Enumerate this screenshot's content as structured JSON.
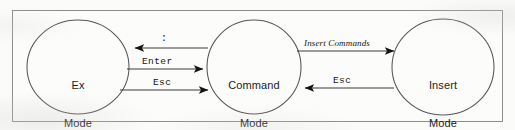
{
  "figure": {
    "kind": "state-diagram",
    "frame": {
      "stroke": "#8f8f8f",
      "fill": "#fcfcfb"
    },
    "background": "#fbfbfa",
    "ink": "#2a2a2a"
  },
  "nodes": [
    {
      "id": "ex",
      "label": "Ex\nMode",
      "line1": "Ex",
      "line2": "Mode",
      "cx": 78,
      "cy": 67,
      "rx": 51,
      "ry": 47
    },
    {
      "id": "command",
      "label": "Command\nMode",
      "line1": "Command",
      "line2": "Mode",
      "cx": 254,
      "cy": 67,
      "rx": 47,
      "ry": 47
    },
    {
      "id": "insert",
      "label": "Insert\nMode",
      "line1": "Insert",
      "line2": "Mode",
      "cx": 443,
      "cy": 67,
      "rx": 51,
      "ry": 48
    }
  ],
  "edges": [
    {
      "id": "command-to-ex",
      "label": ":",
      "style": "mono",
      "from": "command",
      "to": "ex",
      "direction": "left",
      "y": 48
    },
    {
      "id": "ex-to-command",
      "label": "Enter",
      "style": "mono",
      "from": "ex",
      "to": "command",
      "direction": "right",
      "y": 69
    },
    {
      "id": "ex-to-command-esc",
      "label": "Esc",
      "style": "mono",
      "from": "ex",
      "to": "command",
      "direction": "right",
      "y": 90
    },
    {
      "id": "command-to-insert",
      "label": "Insert Commands",
      "style": "italic",
      "from": "command",
      "to": "insert",
      "direction": "right",
      "y": 51
    },
    {
      "id": "insert-to-command",
      "label": "Esc",
      "style": "mono",
      "from": "insert",
      "to": "command",
      "direction": "left",
      "y": 88
    }
  ]
}
